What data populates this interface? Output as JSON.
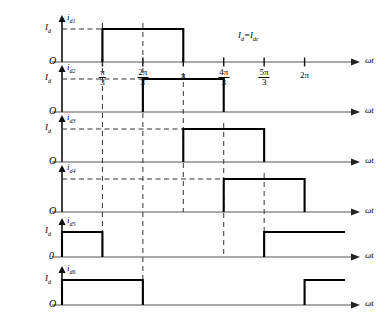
{
  "figure": {
    "annotation": "Iₐ=Idc",
    "annotation_parts": {
      "left": "I",
      "left_sub": "d",
      "eq": "=",
      "right": "I",
      "right_sub": "dc"
    },
    "origin_labels": [
      "O",
      "O",
      "O",
      "O",
      "0",
      "O"
    ],
    "amplitude_label": "I",
    "amplitude_sub": "d",
    "axis_label": "ωt",
    "x_tick_labels": [
      "π/3",
      "2π/3",
      "π",
      "4π/3",
      "5π/3",
      "2π"
    ],
    "signal_labels": [
      {
        "base": "i",
        "sub": "d1"
      },
      {
        "base": "i",
        "sub": "d2"
      },
      {
        "base": "i",
        "sub": "d3"
      },
      {
        "base": "i",
        "sub": "d4"
      },
      {
        "base": "i",
        "sub": "d5"
      },
      {
        "base": "i",
        "sub": "d6"
      }
    ]
  },
  "chart_data": {
    "type": "line",
    "title": "",
    "subtitle": "",
    "xlabel": "ωt",
    "ylabel": "",
    "grid": false,
    "legend": null,
    "xlim": [
      0,
      7.33
    ],
    "ylim": [
      0,
      1.3
    ],
    "x_unit": "radians",
    "x_ticks": [
      1.0472,
      2.0944,
      3.1416,
      4.1888,
      5.236,
      6.2832
    ],
    "x_tick_labels": [
      "π/3",
      "2π/3",
      "π",
      "4π/3",
      "5π/3",
      "2π"
    ],
    "y_ticks": [
      1.0
    ],
    "y_tick_labels": [
      "Id"
    ],
    "amplitude": 1.0,
    "annotations": [
      {
        "text": "Id=Idc",
        "x": 4.6,
        "y": 0.75
      }
    ],
    "series": [
      {
        "name": "i_d1",
        "type": "square-pulse",
        "amplitude": 1.0,
        "on_intervals": [
          [
            1.0472,
            3.1416
          ]
        ],
        "values": [
          0,
          1,
          1,
          0,
          0
        ],
        "x": [
          0,
          1.0472,
          3.1416,
          3.1416,
          7.33
        ]
      },
      {
        "name": "i_d2",
        "type": "square-pulse",
        "amplitude": 1.0,
        "on_intervals": [
          [
            2.0944,
            4.1888
          ]
        ],
        "values": [
          0,
          1,
          1,
          0,
          0
        ],
        "x": [
          0,
          2.0944,
          4.1888,
          4.1888,
          7.33
        ]
      },
      {
        "name": "i_d3",
        "type": "square-pulse",
        "amplitude": 1.0,
        "on_intervals": [
          [
            3.1416,
            5.236
          ]
        ],
        "values": [
          0,
          1,
          1,
          0,
          0
        ],
        "x": [
          0,
          3.1416,
          5.236,
          5.236,
          7.33
        ]
      },
      {
        "name": "i_d4",
        "type": "square-pulse",
        "amplitude": 1.0,
        "on_intervals": [
          [
            4.1888,
            6.2832
          ]
        ],
        "values": [
          0,
          1,
          1,
          0,
          0
        ],
        "x": [
          0,
          4.1888,
          6.2832,
          6.2832,
          7.33
        ]
      },
      {
        "name": "i_d5",
        "type": "square-pulse",
        "amplitude": 1.0,
        "on_intervals": [
          [
            0,
            1.0472
          ],
          [
            5.236,
            7.33
          ]
        ],
        "values": [
          1,
          1,
          0,
          0,
          1,
          1
        ],
        "x": [
          0,
          1.0472,
          1.0472,
          5.236,
          5.236,
          7.33
        ]
      },
      {
        "name": "i_d6",
        "type": "square-pulse",
        "amplitude": 1.0,
        "on_intervals": [
          [
            0,
            2.0944
          ],
          [
            6.2832,
            7.33
          ]
        ],
        "values": [
          1,
          1,
          0,
          0,
          1,
          1
        ],
        "x": [
          0,
          2.0944,
          2.0944,
          6.2832,
          6.2832,
          7.33
        ]
      }
    ]
  }
}
